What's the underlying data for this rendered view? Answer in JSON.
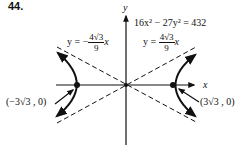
{
  "problem_number": "44.",
  "equation": "16x² − 27y² = 432",
  "axes": {
    "x_label": "x",
    "y_label": "y"
  },
  "asymptotes": {
    "negative": {
      "prefix": "y = −",
      "numerator": "4√3",
      "denominator": "9",
      "suffix": "x"
    },
    "positive": {
      "prefix": "y = ",
      "numerator": "4√3",
      "denominator": "9",
      "suffix": "x"
    }
  },
  "vertices": {
    "left": "(−3√3 , 0)",
    "right": "(3√3 , 0)"
  },
  "colors": {
    "ink": "#111111",
    "background": "#ffffff"
  }
}
